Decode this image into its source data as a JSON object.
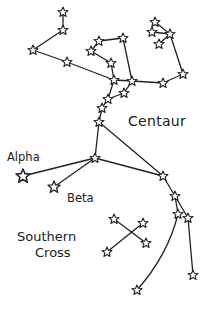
{
  "diagram": {
    "type": "star-chart",
    "ink_color": "#222222",
    "background": "#ffffff",
    "labels": {
      "centaur": "Centaur",
      "alpha": "Alpha",
      "beta": "Beta",
      "southern": "Southern",
      "cross": "Cross"
    },
    "constellations": [
      {
        "name": "Centaur",
        "star_count": 26
      },
      {
        "name": "Southern Cross",
        "star_count": 4
      }
    ],
    "named_stars": [
      "Alpha",
      "Beta"
    ]
  }
}
